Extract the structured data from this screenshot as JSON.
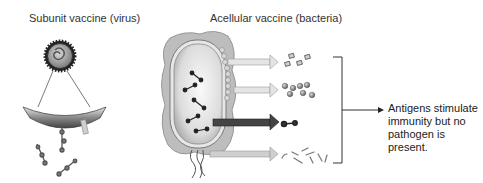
{
  "panels": {
    "subunit": {
      "title": "Subunit vaccine (virus)"
    },
    "acellular": {
      "title": "Acellular vaccine (bacteria)",
      "components": [
        {
          "name": "protein-subunits",
          "arrow_color": "#c8c8c8"
        },
        {
          "name": "spherical-antigens",
          "arrow_color": "#c8c8c8"
        },
        {
          "name": "toxin-molecule",
          "arrow_color": "#444444"
        },
        {
          "name": "pilus-fragments",
          "arrow_color": "#bdbdbd"
        }
      ]
    }
  },
  "conclusion": {
    "lines": [
      "Antigens stimulate",
      "immunity but no",
      "pathogen is",
      "present."
    ]
  },
  "colors": {
    "cell_outer": "#bdbdbd",
    "cell_inner": "#e6e6e6",
    "dark_arrow": "#444444",
    "light_arrow": "#cfcfcf",
    "virus_shell": "#222222"
  }
}
